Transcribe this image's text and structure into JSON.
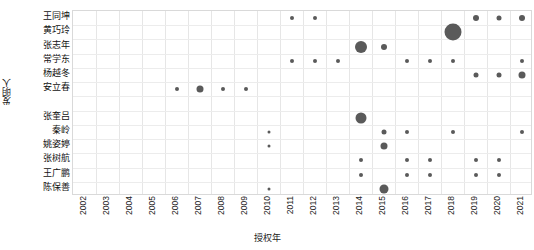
{
  "chart_data": {
    "type": "scatter",
    "title": "",
    "xlabel": "授权年",
    "ylabel": "发明人",
    "grid": true,
    "legend": false,
    "x_categories": [
      "2002",
      "2003",
      "2004",
      "2005",
      "2006",
      "2007",
      "2008",
      "2009",
      "2010",
      "2011",
      "2012",
      "2013",
      "2014",
      "2015",
      "2016",
      "2017",
      "2018",
      "2019",
      "2020",
      "2021"
    ],
    "y_categories": [
      "王同坤",
      "黄巧玲",
      "张志年",
      "常学东",
      "杨越冬",
      "安立春",
      "张奎吕",
      "秦岭",
      "姚姿婷",
      "张树航",
      "王广鹏",
      "陈保善"
    ],
    "y_row_index": {
      "王同坤": 0,
      "黄巧玲": 1,
      "张志年": 2,
      "常学东": 3,
      "杨越冬": 4,
      "安立春": 5,
      "张奎吕": 7,
      "秦岭": 8,
      "姚姿婷": 9,
      "张树航": 10,
      "王广鹏": 11,
      "陈保善": 12
    },
    "point_color": "#5a5a5a",
    "size_encoding": "bubble area ~ patent count",
    "points": [
      {
        "inventor": "王同坤",
        "year": "2011",
        "size": 4
      },
      {
        "inventor": "王同坤",
        "year": "2012",
        "size": 4
      },
      {
        "inventor": "王同坤",
        "year": "2019",
        "size": 6
      },
      {
        "inventor": "王同坤",
        "year": "2020",
        "size": 5
      },
      {
        "inventor": "王同坤",
        "year": "2021",
        "size": 6
      },
      {
        "inventor": "黄巧玲",
        "year": "2018",
        "size": 17
      },
      {
        "inventor": "张志年",
        "year": "2014",
        "size": 12
      },
      {
        "inventor": "张志年",
        "year": "2015",
        "size": 6
      },
      {
        "inventor": "常学东",
        "year": "2011",
        "size": 4
      },
      {
        "inventor": "常学东",
        "year": "2012",
        "size": 4
      },
      {
        "inventor": "常学东",
        "year": "2013",
        "size": 4
      },
      {
        "inventor": "常学东",
        "year": "2016",
        "size": 4
      },
      {
        "inventor": "常学东",
        "year": "2017",
        "size": 4
      },
      {
        "inventor": "常学东",
        "year": "2018",
        "size": 4
      },
      {
        "inventor": "常学东",
        "year": "2021",
        "size": 4
      },
      {
        "inventor": "杨越冬",
        "year": "2019",
        "size": 5
      },
      {
        "inventor": "杨越冬",
        "year": "2020",
        "size": 5
      },
      {
        "inventor": "杨越冬",
        "year": "2021",
        "size": 7
      },
      {
        "inventor": "安立春",
        "year": "2006",
        "size": 4
      },
      {
        "inventor": "安立春",
        "year": "2007",
        "size": 7
      },
      {
        "inventor": "安立春",
        "year": "2008",
        "size": 4
      },
      {
        "inventor": "安立春",
        "year": "2009",
        "size": 4
      },
      {
        "inventor": "张奎吕",
        "year": "2014",
        "size": 11
      },
      {
        "inventor": "秦岭",
        "year": "2010",
        "size": 3
      },
      {
        "inventor": "秦岭",
        "year": "2015",
        "size": 5
      },
      {
        "inventor": "秦岭",
        "year": "2016",
        "size": 4
      },
      {
        "inventor": "秦岭",
        "year": "2018",
        "size": 4
      },
      {
        "inventor": "秦岭",
        "year": "2021",
        "size": 4
      },
      {
        "inventor": "姚姿婷",
        "year": "2010",
        "size": 3
      },
      {
        "inventor": "姚姿婷",
        "year": "2015",
        "size": 7
      },
      {
        "inventor": "张树航",
        "year": "2014",
        "size": 4
      },
      {
        "inventor": "张树航",
        "year": "2016",
        "size": 4
      },
      {
        "inventor": "张树航",
        "year": "2017",
        "size": 4
      },
      {
        "inventor": "张树航",
        "year": "2019",
        "size": 4
      },
      {
        "inventor": "张树航",
        "year": "2020",
        "size": 4
      },
      {
        "inventor": "王广鹏",
        "year": "2014",
        "size": 4
      },
      {
        "inventor": "王广鹏",
        "year": "2016",
        "size": 4
      },
      {
        "inventor": "王广鹏",
        "year": "2017",
        "size": 4
      },
      {
        "inventor": "王广鹏",
        "year": "2019",
        "size": 4
      },
      {
        "inventor": "王广鹏",
        "year": "2020",
        "size": 4
      },
      {
        "inventor": "陈保善",
        "year": "2010",
        "size": 3
      },
      {
        "inventor": "陈保善",
        "year": "2015",
        "size": 9
      }
    ]
  }
}
